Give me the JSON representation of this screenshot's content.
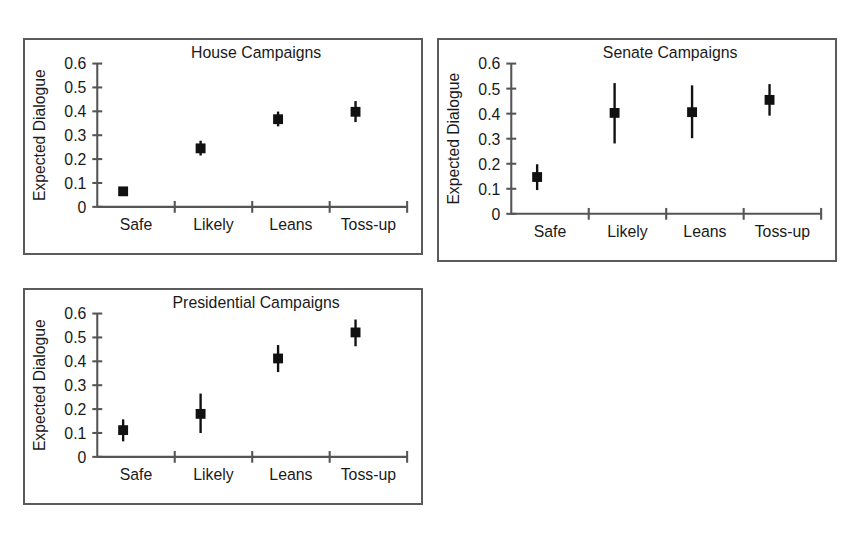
{
  "figure": {
    "background_color": "#ffffff",
    "panel_border_color": "#5b5b5b",
    "axis_color": "#555555",
    "marker_color": "#111111"
  },
  "chart_data": [
    {
      "type": "scatter",
      "id": "house",
      "title": "House Campaigns",
      "xlabel": "",
      "ylabel": "Expected Dialogue",
      "categories": [
        "Safe",
        "Likely",
        "Leans",
        "Toss-up"
      ],
      "values": [
        0.065,
        0.245,
        0.367,
        0.398
      ],
      "error_low": [
        0.052,
        0.215,
        0.337,
        0.355
      ],
      "error_high": [
        0.079,
        0.277,
        0.399,
        0.443
      ],
      "ylim": [
        0,
        0.6
      ],
      "yticks": [
        0,
        0.1,
        0.2,
        0.3,
        0.4,
        0.5,
        0.6
      ],
      "ytick_labels": [
        "0",
        "0.1",
        "0.2",
        "0.3",
        "0.4",
        "0.5",
        "0.6"
      ],
      "grid": false,
      "legend": "none"
    },
    {
      "type": "scatter",
      "id": "senate",
      "title": "Senate Campaigns",
      "xlabel": "",
      "ylabel": "Expected Dialogue",
      "categories": [
        "Safe",
        "Likely",
        "Leans",
        "Toss-up"
      ],
      "values": [
        0.147,
        0.403,
        0.406,
        0.455
      ],
      "error_low": [
        0.095,
        0.281,
        0.302,
        0.392
      ],
      "error_high": [
        0.198,
        0.522,
        0.513,
        0.518
      ],
      "ylim": [
        0,
        0.6
      ],
      "yticks": [
        0,
        0.1,
        0.2,
        0.3,
        0.4,
        0.5,
        0.6
      ],
      "ytick_labels": [
        "0",
        "0.1",
        "0.2",
        "0.3",
        "0.4",
        "0.5",
        "0.6"
      ],
      "grid": false,
      "legend": "none"
    },
    {
      "type": "scatter",
      "id": "presidential",
      "title": "Presidential Campaigns",
      "xlabel": "",
      "ylabel": "Expected Dialogue",
      "categories": [
        "Safe",
        "Likely",
        "Leans",
        "Toss-up"
      ],
      "values": [
        0.112,
        0.18,
        0.412,
        0.521
      ],
      "error_low": [
        0.065,
        0.1,
        0.355,
        0.463
      ],
      "error_high": [
        0.157,
        0.265,
        0.468,
        0.575
      ],
      "ylim": [
        0,
        0.6
      ],
      "yticks": [
        0,
        0.1,
        0.2,
        0.3,
        0.4,
        0.5,
        0.6
      ],
      "ytick_labels": [
        "0",
        "0.1",
        "0.2",
        "0.3",
        "0.4",
        "0.5",
        "0.6"
      ],
      "grid": false,
      "legend": "none"
    }
  ]
}
